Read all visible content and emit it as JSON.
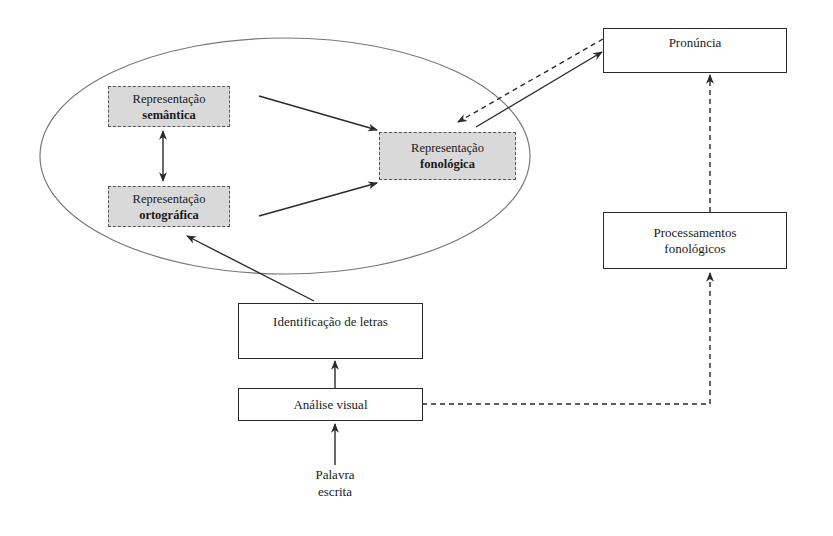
{
  "diagram": {
    "type": "reading-process-model",
    "language": "pt",
    "ellipse": {
      "cx": 285,
      "cy": 156,
      "rx": 245,
      "ry": 118
    },
    "nodes": {
      "semantica": {
        "line1": "Representação",
        "line2": "semântica",
        "shaded": true
      },
      "ortografica": {
        "line1": "Representação",
        "line2": "ortográfica",
        "shaded": true
      },
      "fonologica": {
        "line1": "Representação",
        "line2": "fonológica",
        "shaded": true
      },
      "pronuncia": {
        "label": "Pronúncia"
      },
      "processamentos": {
        "line1": "Processamentos",
        "line2": "fonológicos"
      },
      "identificacao": {
        "label": "Identificação de letras"
      },
      "analise": {
        "label": "Análise visual"
      },
      "palavra": {
        "line1": "Palavra",
        "line2": "escrita"
      }
    },
    "edges": [
      {
        "from": "palavra",
        "to": "analise",
        "style": "solid"
      },
      {
        "from": "analise",
        "to": "identificacao",
        "style": "solid"
      },
      {
        "from": "identificacao",
        "to": "ortografica",
        "style": "solid"
      },
      {
        "from": "semantica",
        "to": "ortografica",
        "style": "solid",
        "bidirectional": true
      },
      {
        "from": "semantica",
        "to": "fonologica",
        "style": "solid"
      },
      {
        "from": "ortografica",
        "to": "fonologica",
        "style": "solid"
      },
      {
        "from": "fonologica",
        "to": "pronuncia",
        "style": "solid"
      },
      {
        "from": "pronuncia",
        "to": "fonologica",
        "style": "dashed"
      },
      {
        "from": "analise",
        "to": "processamentos",
        "style": "dashed"
      },
      {
        "from": "processamentos",
        "to": "pronuncia",
        "style": "dashed"
      }
    ],
    "colors": {
      "line": "#2a2a2a",
      "ellipse": "#777777",
      "shade": "#d9d9d9"
    }
  }
}
